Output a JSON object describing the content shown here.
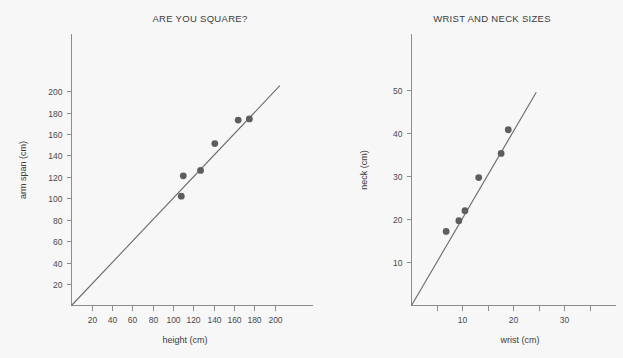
{
  "figure": {
    "background_color": "#f7f7f7",
    "ink_color": "#5e5e5e",
    "axis_color": "#8d8d8d"
  },
  "chart_data": [
    {
      "type": "scatter",
      "title": "ARE YOU SQUARE?",
      "xlabel": "height (cm)",
      "ylabel": "arm span (cm)",
      "xlim": [
        0,
        215
      ],
      "ylim": [
        0,
        215
      ],
      "grid": false,
      "legend": "none",
      "xticks": [
        20,
        40,
        60,
        80,
        100,
        120,
        140,
        160,
        180,
        200
      ],
      "xtick_labels": [
        "20",
        "40",
        "60",
        "80",
        "100",
        "120",
        "140",
        "160",
        "180",
        "200"
      ],
      "yticks": [
        20,
        40,
        60,
        80,
        100,
        120,
        140,
        160,
        180,
        200
      ],
      "ytick_labels": [
        "20",
        "40",
        "60",
        "80",
        "100",
        "120",
        "140",
        "160",
        "180",
        "200"
      ],
      "points": [
        {
          "x": 108,
          "y": 102
        },
        {
          "x": 110,
          "y": 121
        },
        {
          "x": 127,
          "y": 126
        },
        {
          "x": 141,
          "y": 151
        },
        {
          "x": 164,
          "y": 173
        },
        {
          "x": 175,
          "y": 174
        }
      ],
      "fit_line": {
        "x_start": 0,
        "y_start": 0,
        "x_end": 205,
        "y_end": 205,
        "slope": 1.0,
        "intercept": 0
      }
    },
    {
      "type": "scatter",
      "title": "WRIST AND NECK SIZES",
      "xlabel": "wrist (cm)",
      "ylabel": "neck (cm)",
      "xlim": [
        0,
        38
      ],
      "ylim": [
        0,
        57
      ],
      "grid": false,
      "legend": "none",
      "xticks": [
        5,
        10,
        15,
        20,
        25,
        30,
        35
      ],
      "xtick_labels": [
        "",
        "10",
        "",
        "20",
        "",
        "30",
        ""
      ],
      "yticks": [
        10,
        20,
        30,
        40,
        50
      ],
      "ytick_labels": [
        "10",
        "20",
        "30",
        "40",
        "50"
      ],
      "points": [
        {
          "x": 6.8,
          "y": 17.2
        },
        {
          "x": 9.3,
          "y": 19.7
        },
        {
          "x": 10.5,
          "y": 22.0
        },
        {
          "x": 13.2,
          "y": 29.7
        },
        {
          "x": 17.6,
          "y": 35.3
        },
        {
          "x": 19.0,
          "y": 40.8
        }
      ],
      "fit_line": {
        "x_start": 0,
        "y_start": 0,
        "x_end": 24.5,
        "y_end": 49.5,
        "slope": 2.02,
        "intercept": 0
      }
    }
  ]
}
